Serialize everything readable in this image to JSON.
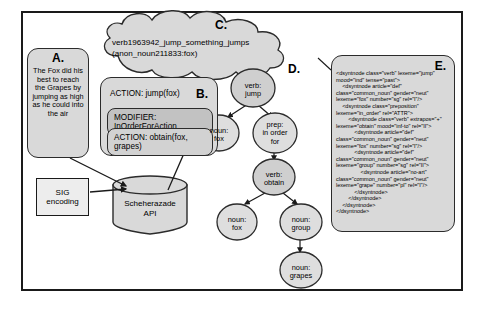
{
  "figure": {
    "panel_a": {
      "letter": "A.",
      "story": "The Fox did his best to reach the Grapes by jumping as high as he could into the air"
    },
    "panel_b": {
      "letter": "B.",
      "action_top": "ACTION: jump(fox)",
      "modifier": "MODIFIER: InOrderForAction",
      "action_bottom": "ACTION: obtain(fox, grapes)"
    },
    "panel_c": {
      "letter": "C.",
      "line1": "verb1963942_jump_something_jumps",
      "line2": "(anon_noun211833:fox)"
    },
    "panel_d": {
      "letter": "D.",
      "nodes": [
        {
          "id": "verb-jump",
          "line1": "verb:",
          "line2": "jump"
        },
        {
          "id": "noun-fox-1",
          "line1": "noun:",
          "line2": "fox"
        },
        {
          "id": "prep-in-order-for",
          "line1": "prep:",
          "line2": "in order",
          "line3": "for"
        },
        {
          "id": "verb-obtain",
          "line1": "verb:",
          "line2": "obtain"
        },
        {
          "id": "noun-fox-2",
          "line1": "noun:",
          "line2": "fox"
        },
        {
          "id": "noun-group",
          "line1": "noun:",
          "line2": "group"
        },
        {
          "id": "noun-grapes",
          "line1": "noun:",
          "line2": "grapes"
        }
      ]
    },
    "panel_e": {
      "letter": "E.",
      "xml": "<dsyntnode class=\"verb\" lexeme=\"jump\" mood=\"ind\" tense=\"past\">\n    <dsyntnode article=\"def\" class=\"common_noun\" gender=\"neut\" lexeme=\"fox\" number=\"sg\" rel=\"I\"/>\n    <dsyntnode class=\"preposition\" lexeme=\"in_order\" rel=\"ATTR\">\n        <dsyntnode class=\"verb\" extrapos=\"+\" lexeme=\"obtain\" mood=\"inf-to\" rel=\"II\">\n            <dsyntnode article=\"def\" class=\"common_noun\" gender=\"neut\" lexeme=\"fox\" number=\"sg\" rel=\"I\"/>\n            <dsyntnode article=\"def\" class=\"common_noun\" gender=\"neut\" lexeme=\"group\" number=\"sg\" rel=\"II\">\n                <dsyntnode article=\"no-art\" class=\"common_noun\" gender=\"neut\" lexeme=\"grape\" number=\"pl\" rel=\"I\"/>\n            </dsyntnode>\n        </dsyntnode>\n    </dsyntnode>\n</dsyntnode>"
    },
    "sig_box": {
      "line1": "SIG",
      "line2": "encoding"
    },
    "database": {
      "line1": "Scheherazade",
      "line2": "API"
    }
  },
  "colors": {
    "box_fill": "#d9d9d9",
    "inner_fill": "#c2c2c2",
    "stroke": "#2b2b2b",
    "frame": "#1a1a1a",
    "white_fill": "#ededed"
  }
}
